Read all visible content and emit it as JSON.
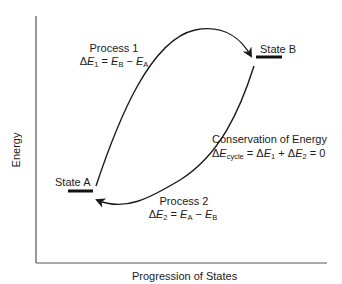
{
  "diagram": {
    "type": "energy-state-cycle",
    "axes": {
      "y_label": "Energy",
      "x_label": "Progression of States"
    },
    "states": [
      {
        "id": "A",
        "label": "State A"
      },
      {
        "id": "B",
        "label": "State B"
      }
    ],
    "processes": [
      {
        "id": 1,
        "title": "Process 1",
        "equation": {
          "lhs_delta": "Δ",
          "lhs_var": "E",
          "lhs_sub": "1",
          "eq": " = ",
          "t1_var": "E",
          "t1_sub": "B",
          "op": " − ",
          "t2_var": "E",
          "t2_sub": "A"
        },
        "from": "A",
        "to": "B"
      },
      {
        "id": 2,
        "title": "Process 2",
        "equation": {
          "lhs_delta": "Δ",
          "lhs_var": "E",
          "lhs_sub": "2",
          "eq": " = ",
          "t1_var": "E",
          "t1_sub": "A",
          "op": " − ",
          "t2_var": "E",
          "t2_sub": "B"
        },
        "from": "B",
        "to": "A"
      }
    ],
    "conservation": {
      "title": "Conservation of Energy",
      "equation": {
        "delta": "Δ",
        "var": "E",
        "sub": "cycle",
        "eq": " = ",
        "d1": "Δ",
        "v1": "E",
        "s1": "1",
        "plus": " + ",
        "d2": "Δ",
        "v2": "E",
        "s2": "2",
        "rhs": " = 0"
      }
    },
    "colors": {
      "line": "#1a1a1a",
      "axis": "#555555",
      "background": "#ffffff"
    }
  }
}
